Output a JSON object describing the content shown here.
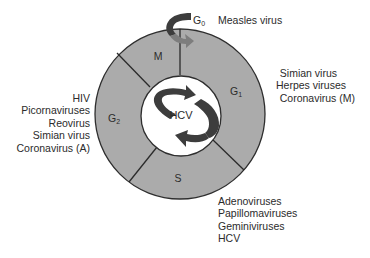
{
  "diagram": {
    "type": "cell-cycle",
    "colors": {
      "ring_fill": "#ababab",
      "ring_stroke": "#2e2e2e",
      "inner_fill": "#ffffff",
      "arrow_dark": "#3d3d3d",
      "arrow_light": "#7d7d7d",
      "text": "#2b2b2b"
    },
    "center_label": "HCV",
    "phases": [
      {
        "id": "G0",
        "main": "G",
        "sub": "0"
      },
      {
        "id": "M",
        "main": "M",
        "sub": ""
      },
      {
        "id": "G1",
        "main": "G",
        "sub": "1"
      },
      {
        "id": "S",
        "main": "S",
        "sub": ""
      },
      {
        "id": "G2",
        "main": "G",
        "sub": "2"
      }
    ],
    "viruses": {
      "G0": [
        "Measles virus"
      ],
      "G1": [
        "Simian virus",
        "Herpes viruses",
        "Coronavirus (M)"
      ],
      "G2": [
        "HIV",
        "Picornaviruses",
        "Reovirus",
        "Simian virus",
        "Coronavirus (A)"
      ],
      "S": [
        "Adenoviruses",
        "Papillomaviruses",
        "Geminiviruses",
        "HCV"
      ]
    }
  }
}
